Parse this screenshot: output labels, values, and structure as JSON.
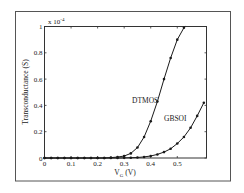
{
  "chart_data": {
    "type": "line",
    "title": "",
    "xlabel": "V_G (V)",
    "xlabel_main": "V",
    "xlabel_sub": "G",
    "xlabel_unit": "(V)",
    "ylabel": "Transconductance (S)",
    "y_multiplier": "x 10",
    "y_multiplier_exp": "-4",
    "xlim": [
      0,
      0.61
    ],
    "ylim": [
      0,
      1
    ],
    "x_ticks": [
      0,
      0.1,
      0.2,
      0.3,
      0.4,
      0.5
    ],
    "x_tick_labels": [
      "0",
      "0.1",
      "0.2",
      "0.3",
      "0.4",
      "0.5"
    ],
    "y_ticks": [
      0,
      0.2,
      0.4,
      0.6,
      0.8,
      1
    ],
    "y_tick_labels": [
      "0",
      "0.2",
      "0.4",
      "0.6",
      "0.8",
      "1"
    ],
    "grid": false,
    "legend": "inline labels",
    "series": [
      {
        "name": "DTMOS",
        "x": [
          0,
          0.025,
          0.05,
          0.075,
          0.1,
          0.125,
          0.15,
          0.175,
          0.2,
          0.225,
          0.25,
          0.275,
          0.3,
          0.325,
          0.35,
          0.375,
          0.4,
          0.425,
          0.45,
          0.475,
          0.5,
          0.525,
          0.53
        ],
        "values": [
          0,
          0,
          0,
          0,
          0,
          0,
          0,
          0,
          0,
          0,
          0.003,
          0.007,
          0.015,
          0.035,
          0.08,
          0.16,
          0.28,
          0.43,
          0.6,
          0.76,
          0.9,
          0.99,
          1.0
        ]
      },
      {
        "name": "GBSOI",
        "x": [
          0,
          0.025,
          0.05,
          0.075,
          0.1,
          0.125,
          0.15,
          0.175,
          0.2,
          0.225,
          0.25,
          0.275,
          0.3,
          0.325,
          0.35,
          0.375,
          0.4,
          0.425,
          0.45,
          0.475,
          0.5,
          0.525,
          0.55,
          0.575,
          0.6
        ],
        "values": [
          0,
          0,
          0,
          0,
          0,
          0,
          0,
          0,
          0,
          0,
          0,
          0,
          0.001,
          0.002,
          0.004,
          0.008,
          0.015,
          0.027,
          0.045,
          0.07,
          0.11,
          0.16,
          0.23,
          0.32,
          0.42
        ]
      }
    ]
  },
  "annotations": {
    "dtmos_label": "DTMOS",
    "gbsoi_label": "GBSOI"
  },
  "colors": {
    "line": "#1a1a1a",
    "frame": "#444444",
    "background": "#ffffff"
  }
}
